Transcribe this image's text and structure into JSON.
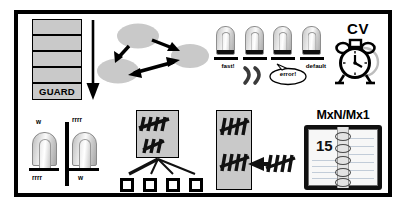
{
  "diagram": {
    "frame": {
      "border_color": "#000000",
      "background": "#ffffff",
      "shadow_color": "#c9c9c9"
    },
    "palette": {
      "ink": "#000000",
      "fill_gray": "#c9c9c9",
      "paper": "#ffffff",
      "metal_light": "#fafafa",
      "metal_dark": "#a9a9a9"
    },
    "panels": [
      {
        "id": "guard-stack",
        "name": "guard-stack"
      },
      {
        "id": "graph",
        "name": "node-graph"
      },
      {
        "id": "lock-row",
        "name": "lock-row"
      },
      {
        "id": "cv",
        "name": "cv-alarm-clock"
      },
      {
        "id": "mirror-locks",
        "name": "mirrored-lock-pair"
      },
      {
        "id": "fanout",
        "name": "tally-fanout"
      },
      {
        "id": "tallybox",
        "name": "tally-box-incoming"
      },
      {
        "id": "notebook",
        "name": "mxn-notebook"
      }
    ]
  },
  "guard_stack": {
    "rows": [
      "",
      "",
      "",
      ""
    ],
    "bottom_label": "GUARD",
    "arrow_direction": "down"
  },
  "graph": {
    "nodes": [
      {
        "id": "n-top",
        "label": ""
      },
      {
        "id": "n-left",
        "label": ""
      },
      {
        "id": "n-right",
        "label": ""
      }
    ],
    "edges": [
      {
        "from": "n-top",
        "to": "n-left",
        "heads": "single"
      },
      {
        "from": "n-left",
        "to": "n-right",
        "heads": "double"
      },
      {
        "from": "n-top",
        "to": "n-right",
        "heads": "double"
      }
    ]
  },
  "lock_row": {
    "locks": [
      {
        "caption": "fast!",
        "annotation": ""
      },
      {
        "caption": "",
        "annotation": "snore"
      },
      {
        "caption": "",
        "annotation": "error!"
      },
      {
        "caption": "default",
        "annotation": ""
      }
    ],
    "snore_glyph": ") )",
    "error_bubble": "error!"
  },
  "cv": {
    "label": "CV",
    "icon": "alarm-clock-icon"
  },
  "mirror_locks": {
    "left_lock": {
      "top_label": "w",
      "bottom_label": "rrrr"
    },
    "right_lock": {
      "top_label": "rrrr",
      "bottom_label": "w"
    },
    "divider": "vertical-bar"
  },
  "fanout": {
    "source_box": {
      "tally_groups": [
        5,
        3
      ]
    },
    "leaf_count": 4,
    "leaves": [
      "",
      "",
      "",
      ""
    ]
  },
  "tallybox": {
    "box": {
      "tally_groups": [
        5,
        5
      ]
    },
    "incoming": {
      "tally_group": 5,
      "arrow_direction": "left"
    }
  },
  "notebook": {
    "label": "MxN/Mx1",
    "page_number": "15",
    "ring_count": 5,
    "line_count": 7
  }
}
